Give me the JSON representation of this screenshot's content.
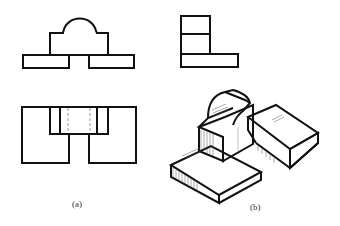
{
  "figure": {
    "captions": {
      "a": "(a)",
      "b": "(b)"
    },
    "colors": {
      "stroke": "#111111",
      "hidden_line": "#999999",
      "hatch": "#555555",
      "background": "#ffffff"
    },
    "views": {
      "front_view": "Front view: two base slabs with central block topped by semicircular arc",
      "side_view": "Side view: L-shaped profile, stacked rectangles on long base",
      "top_view": "Top view: outer rectangle with central notch and hidden dashed lines",
      "isometric_view": "Isometric view: central block with cylindrical top resting on two offset base slabs"
    }
  }
}
